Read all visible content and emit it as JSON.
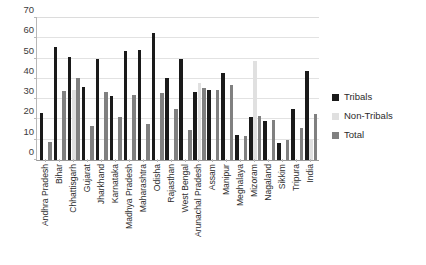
{
  "chart_data": {
    "type": "bar",
    "title": "",
    "xlabel": "",
    "ylabel": "",
    "ylim": [
      0,
      70
    ],
    "yticks": [
      0,
      10,
      20,
      30,
      40,
      50,
      60,
      70
    ],
    "grid": true,
    "legend_position": "right",
    "categories": [
      "Andhra Pradesh",
      "Bihar",
      "Chhattisgarh",
      "Gujarat",
      "Jharkhand",
      "Karnataka",
      "Madhya Pradesh",
      "Maharashtra",
      "Odisha",
      "Rajasthan",
      "West Bengal",
      "Arunachal Pradesh",
      "Assam",
      "Manipur",
      "Meghalaya",
      "Mizoram",
      "Nagaland",
      "Sikkim",
      "Tripura",
      "India"
    ],
    "series": [
      {
        "name": "Tribals",
        "color": "#1a1a1a",
        "values": [
          23.0,
          55.6,
          51.0,
          36.0,
          49.8,
          31.4,
          53.5,
          54.4,
          62.4,
          40.3,
          49.6,
          33.5,
          34.4,
          43.0,
          12.2,
          21.0,
          19.4,
          8.2,
          25.2,
          43.8
        ]
      },
      {
        "name": "Non-Tribals",
        "color": "#e0e0e0",
        "values": [
          0.0,
          0.0,
          34.5,
          0.0,
          0.0,
          0.0,
          0.0,
          0.0,
          0.0,
          0.0,
          0.0,
          38.0,
          0.0,
          0.0,
          0.0,
          49.0,
          0.0,
          0.0,
          0.0,
          10.0
        ]
      },
      {
        "name": "Total",
        "color": "#808080",
        "values": [
          9.0,
          34.0,
          40.2,
          17.0,
          33.6,
          21.2,
          32.0,
          17.6,
          33.2,
          25.2,
          14.8,
          35.5,
          34.5,
          37.2,
          11.6,
          21.5,
          19.5,
          10.0,
          16.0,
          22.7
        ]
      }
    ]
  },
  "legend": {
    "items": [
      {
        "label": "Tribals",
        "icon": "legend-swatch-black"
      },
      {
        "label": "Non-Tribals",
        "icon": "legend-swatch-light-gray"
      },
      {
        "label": "Total",
        "icon": "legend-swatch-gray"
      }
    ]
  }
}
